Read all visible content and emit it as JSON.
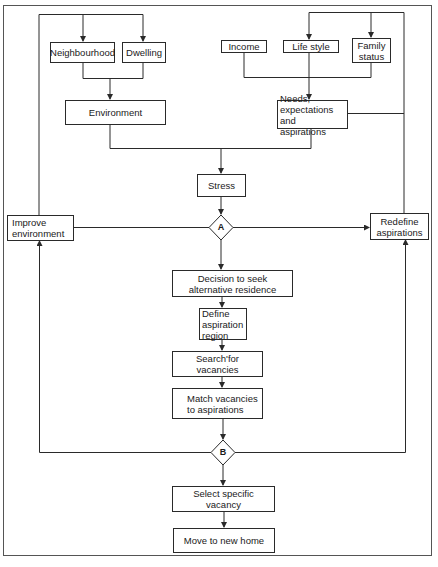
{
  "diagram": {
    "type": "flowchart",
    "colors": {
      "line": "#2a2a2a",
      "background": "#ffffff",
      "frame": "#555555"
    },
    "nodes": {
      "neighbourhood": "Neighbourhood",
      "dwelling": "Dwelling",
      "income": "Income",
      "life_style": "Life style",
      "family_status": "Family\nstatus",
      "environment": "Environment",
      "needs": "Needs,\nexpectations and\naspirations",
      "stress": "Stress",
      "decision_a": "A",
      "improve_environment": "Improve\nenvironment",
      "redefine_aspirations": "Redefine\naspirations",
      "decision_seek": "Decision to seek\nalternative residence",
      "define_region": "Define\naspiration\nregion",
      "search_vacancies": "Search'for vacancies",
      "match_vacancies": "Match vacancies\nto aspirations",
      "decision_b": "B",
      "select_vacancy": "Select specific vacancy",
      "move_home": "Move to new home"
    },
    "edges": [
      [
        "neighbourhood",
        "environment"
      ],
      [
        "dwelling",
        "environment"
      ],
      [
        "income",
        "needs"
      ],
      [
        "life_style",
        "needs"
      ],
      [
        "family_status",
        "needs"
      ],
      [
        "environment",
        "stress"
      ],
      [
        "needs",
        "stress"
      ],
      [
        "stress",
        "decision_a"
      ],
      [
        "decision_a",
        "improve_environment"
      ],
      [
        "decision_a",
        "redefine_aspirations"
      ],
      [
        "decision_a",
        "decision_seek"
      ],
      [
        "improve_environment",
        "neighbourhood"
      ],
      [
        "improve_environment",
        "dwelling"
      ],
      [
        "redefine_aspirations",
        "life_style"
      ],
      [
        "redefine_aspirations",
        "family_status"
      ],
      [
        "redefine_aspirations",
        "needs"
      ],
      [
        "decision_seek",
        "define_region"
      ],
      [
        "define_region",
        "search_vacancies"
      ],
      [
        "search_vacancies",
        "match_vacancies"
      ],
      [
        "match_vacancies",
        "decision_b"
      ],
      [
        "decision_b",
        "improve_environment"
      ],
      [
        "decision_b",
        "redefine_aspirations"
      ],
      [
        "decision_b",
        "select_vacancy"
      ],
      [
        "select_vacancy",
        "move_home"
      ]
    ]
  }
}
